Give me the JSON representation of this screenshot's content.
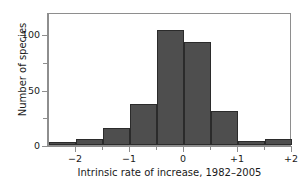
{
  "chart_data": {
    "type": "bar",
    "title": "",
    "subtitle": "",
    "xlabel": "Intrinsic rate of increase, 1982–2005",
    "ylabel": "Number of species",
    "xlim": [
      -2.5,
      2.0
    ],
    "ylim": [
      0,
      120
    ],
    "bin_width": 0.5,
    "grid": false,
    "legend": null,
    "bar_color": "#4e4e4e",
    "bar_edge_color": "#2b2b2b",
    "axis_color": "#8e8e8e",
    "categories": [
      "-2.5 to -2.0",
      "-2.0 to -1.5",
      "-1.5 to -1.0",
      "-1.0 to -0.5",
      "-0.5 to 0.0",
      "0.0 to 0.5",
      "0.5 to 1.0",
      "1.0 to 1.5",
      "1.5 to 2.0"
    ],
    "bin_edges": [
      -2.5,
      -2.0,
      -1.5,
      -1.0,
      -0.5,
      0.0,
      0.5,
      1.0,
      1.5,
      2.0
    ],
    "values": [
      3,
      5,
      15,
      37,
      104,
      93,
      31,
      4,
      5
    ],
    "x_ticks": [
      {
        "value": -2,
        "label": "−2",
        "minor": false
      },
      {
        "value": -1,
        "label": "−1",
        "minor": false
      },
      {
        "value": 0,
        "label": "0",
        "minor": false
      },
      {
        "value": 1,
        "label": "+1",
        "minor": false
      },
      {
        "value": 2,
        "label": "+2",
        "minor": false
      }
    ],
    "x_minor_ticks": [
      -1.5,
      -0.5,
      0.5,
      1.5
    ],
    "y_ticks": [
      {
        "value": 0,
        "label": "0",
        "minor": false
      },
      {
        "value": 25,
        "label": "",
        "minor": true
      },
      {
        "value": 50,
        "label": "50",
        "minor": false
      },
      {
        "value": 75,
        "label": "",
        "minor": true
      },
      {
        "value": 100,
        "label": "100",
        "minor": false
      }
    ]
  }
}
